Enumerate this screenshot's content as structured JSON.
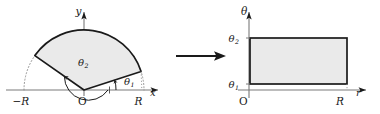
{
  "figure": {
    "left_panel": {
      "name": "polar-sector-diagram",
      "axes": {
        "x_label": "x",
        "y_label": "y",
        "origin_label": "O"
      },
      "tick_labels": {
        "neg_radius": "−R",
        "pos_radius": "R"
      },
      "angles": {
        "inner": "θ",
        "inner_sub": "1",
        "outer": "θ",
        "outer_sub": "2"
      },
      "geometry": {
        "radius_px": 60,
        "theta1_deg": 18,
        "theta2_deg": 145,
        "origin_x": 84,
        "origin_y": 90
      },
      "fill_color": "#eaeaea",
      "stroke_color": "#1a1a1a",
      "axis_color": "#7a7a7a"
    },
    "arrow": {
      "name": "transformation-arrow",
      "x1": 176,
      "x2": 224,
      "y": 56,
      "color": "#1a1a1a"
    },
    "right_panel": {
      "name": "rectangle-diagram",
      "axes": {
        "r_label": "r",
        "theta_label": "θ",
        "origin_label": "O"
      },
      "tick_labels": {
        "theta1": "θ",
        "theta1_sub": "1",
        "theta2": "θ",
        "theta2_sub": "2",
        "radius": "R"
      },
      "geometry": {
        "left": 250,
        "right": 347,
        "top": 38,
        "bottom": 84,
        "axis_x": 249,
        "axis_y": 97
      },
      "fill_color": "#eaeaea",
      "stroke_color": "#1a1a1a",
      "axis_color": "#7a7a7a"
    }
  }
}
